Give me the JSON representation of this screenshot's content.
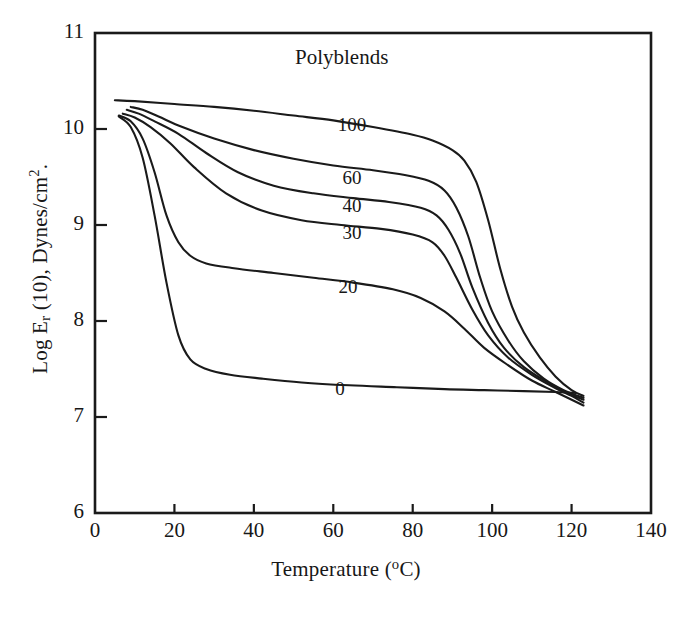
{
  "chart_data": {
    "type": "line",
    "title": "Polyblends",
    "xlabel": "Temperature (°C)",
    "ylabel": "Log E r (10), Dynes/cm2",
    "xlim": [
      0,
      140
    ],
    "ylim": [
      6,
      11
    ],
    "xticks": [
      0,
      20,
      40,
      60,
      80,
      100,
      120,
      140
    ],
    "yticks": [
      6,
      7,
      8,
      9,
      10,
      11
    ],
    "grid": false,
    "legend": "inline curve labels",
    "series": [
      {
        "name": "100",
        "label": "100",
        "points": [
          [
            5,
            10.3
          ],
          [
            10,
            10.29
          ],
          [
            20,
            10.26
          ],
          [
            30,
            10.23
          ],
          [
            40,
            10.19
          ],
          [
            50,
            10.14
          ],
          [
            60,
            10.09
          ],
          [
            70,
            10.02
          ],
          [
            80,
            9.94
          ],
          [
            85,
            9.88
          ],
          [
            90,
            9.78
          ],
          [
            93,
            9.67
          ],
          [
            96,
            9.45
          ],
          [
            99,
            9.05
          ],
          [
            102,
            8.55
          ],
          [
            105,
            8.15
          ],
          [
            108,
            7.88
          ],
          [
            112,
            7.62
          ],
          [
            116,
            7.42
          ],
          [
            120,
            7.28
          ],
          [
            123,
            7.22
          ]
        ]
      },
      {
        "name": "60",
        "label": "60",
        "points": [
          [
            9,
            10.23
          ],
          [
            12,
            10.2
          ],
          [
            16,
            10.13
          ],
          [
            22,
            10.02
          ],
          [
            30,
            9.9
          ],
          [
            40,
            9.78
          ],
          [
            50,
            9.69
          ],
          [
            60,
            9.62
          ],
          [
            70,
            9.57
          ],
          [
            78,
            9.52
          ],
          [
            84,
            9.46
          ],
          [
            88,
            9.36
          ],
          [
            91,
            9.18
          ],
          [
            94,
            8.88
          ],
          [
            97,
            8.45
          ],
          [
            100,
            8.1
          ],
          [
            104,
            7.8
          ],
          [
            108,
            7.58
          ],
          [
            113,
            7.4
          ],
          [
            118,
            7.28
          ],
          [
            123,
            7.2
          ]
        ]
      },
      {
        "name": "40",
        "label": "40",
        "points": [
          [
            8,
            10.2
          ],
          [
            11,
            10.16
          ],
          [
            15,
            10.08
          ],
          [
            21,
            9.95
          ],
          [
            28,
            9.75
          ],
          [
            36,
            9.55
          ],
          [
            45,
            9.41
          ],
          [
            55,
            9.33
          ],
          [
            65,
            9.28
          ],
          [
            74,
            9.24
          ],
          [
            82,
            9.18
          ],
          [
            86,
            9.1
          ],
          [
            89,
            8.95
          ],
          [
            92,
            8.7
          ],
          [
            95,
            8.35
          ],
          [
            99,
            7.98
          ],
          [
            103,
            7.72
          ],
          [
            108,
            7.52
          ],
          [
            114,
            7.36
          ],
          [
            119,
            7.25
          ],
          [
            123,
            7.18
          ]
        ]
      },
      {
        "name": "30",
        "label": "30",
        "points": [
          [
            7,
            10.16
          ],
          [
            10,
            10.12
          ],
          [
            14,
            10.02
          ],
          [
            19,
            9.85
          ],
          [
            25,
            9.6
          ],
          [
            33,
            9.33
          ],
          [
            42,
            9.15
          ],
          [
            52,
            9.05
          ],
          [
            62,
            9.0
          ],
          [
            72,
            8.96
          ],
          [
            80,
            8.9
          ],
          [
            85,
            8.82
          ],
          [
            88,
            8.68
          ],
          [
            91,
            8.45
          ],
          [
            95,
            8.12
          ],
          [
            99,
            7.85
          ],
          [
            104,
            7.62
          ],
          [
            110,
            7.44
          ],
          [
            116,
            7.3
          ],
          [
            120,
            7.22
          ],
          [
            123,
            7.15
          ]
        ]
      },
      {
        "name": "20",
        "label": "20",
        "points": [
          [
            6,
            10.14
          ],
          [
            9,
            10.08
          ],
          [
            12,
            9.9
          ],
          [
            15,
            9.55
          ],
          [
            18,
            9.1
          ],
          [
            21,
            8.82
          ],
          [
            24,
            8.68
          ],
          [
            28,
            8.6
          ],
          [
            35,
            8.55
          ],
          [
            45,
            8.5
          ],
          [
            55,
            8.45
          ],
          [
            65,
            8.4
          ],
          [
            75,
            8.33
          ],
          [
            82,
            8.24
          ],
          [
            88,
            8.1
          ],
          [
            93,
            7.92
          ],
          [
            98,
            7.72
          ],
          [
            104,
            7.54
          ],
          [
            110,
            7.38
          ],
          [
            116,
            7.26
          ],
          [
            123,
            7.12
          ]
        ]
      },
      {
        "name": "0",
        "label": "0",
        "points": [
          [
            6,
            10.13
          ],
          [
            9,
            10.02
          ],
          [
            12,
            9.7
          ],
          [
            15,
            9.1
          ],
          [
            18,
            8.4
          ],
          [
            21,
            7.85
          ],
          [
            24,
            7.6
          ],
          [
            28,
            7.5
          ],
          [
            34,
            7.44
          ],
          [
            42,
            7.4
          ],
          [
            52,
            7.36
          ],
          [
            64,
            7.33
          ],
          [
            76,
            7.31
          ],
          [
            88,
            7.29
          ],
          [
            98,
            7.28
          ],
          [
            108,
            7.27
          ],
          [
            116,
            7.26
          ],
          [
            121,
            7.25
          ]
        ]
      }
    ],
    "curve_labels": [
      {
        "text": "100",
        "x_px": 352,
        "y_px": 114
      },
      {
        "text": "60",
        "x_px": 352,
        "y_px": 167
      },
      {
        "text": "40",
        "x_px": 352,
        "y_px": 195
      },
      {
        "text": "30",
        "x_px": 352,
        "y_px": 222
      },
      {
        "text": "20",
        "x_px": 348,
        "y_px": 276
      },
      {
        "text": "0",
        "x_px": 340,
        "y_px": 378
      }
    ],
    "title_pos": {
      "x_px": 295,
      "y_px": 45
    },
    "colors": {
      "line": "#1a1a1a",
      "axis": "#1a1a1a",
      "background": "#ffffff"
    }
  },
  "axes": {
    "x_tick_labels": [
      "0",
      "20",
      "40",
      "60",
      "80",
      "100",
      "120",
      "140"
    ],
    "y_tick_labels": [
      "6",
      "7",
      "8",
      "9",
      "10",
      "11"
    ],
    "x_title": "Temperature (",
    "x_title_unit": "o",
    "x_title_tail": "C)",
    "y_title_lead": "Log E",
    "y_title_sub": "r",
    "y_title_mid": " (10), Dynes/cm",
    "y_title_sup": "2",
    "y_title_tail": "."
  }
}
